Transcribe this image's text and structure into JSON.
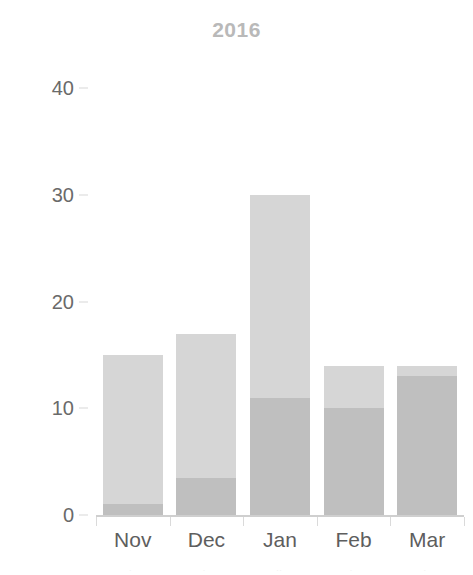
{
  "chart_data": {
    "type": "bar",
    "title": "2016",
    "subtitle": "",
    "xlabel": "",
    "ylabel": "",
    "categories": [
      "Nov",
      "Dec",
      "Jan",
      "Feb",
      "Mar"
    ],
    "stacked": true,
    "series": [
      {
        "name": "lower-segment",
        "color": "#bfbfbf",
        "values": [
          1,
          3.5,
          11,
          10,
          13
        ]
      },
      {
        "name": "upper-segment",
        "color": "#d6d6d6",
        "values": [
          14,
          13.5,
          19,
          4,
          1
        ]
      }
    ],
    "totals": [
      15,
      17,
      30,
      14,
      14
    ],
    "ylim": [
      0,
      42
    ],
    "yticks": [
      0,
      10,
      20,
      30,
      40
    ],
    "ytick_labels": [
      "0",
      "10",
      "20",
      "30",
      "40"
    ],
    "grid": false,
    "legend": "none",
    "annotations": []
  },
  "axes": {
    "y_labels": [
      "40",
      "30",
      "20",
      "10",
      "0"
    ],
    "x_labels": [
      "Nov",
      "Dec",
      "Jan",
      "Feb",
      "Mar"
    ]
  },
  "colors": {
    "title": "#b9b9b9",
    "tick_text": "#5e5e5e",
    "axis_line": "#cfcfcf",
    "bar_lower": "#bfbfbf",
    "bar_upper": "#d6d6d6",
    "background": "#ffffff"
  },
  "artifact": {
    "blips": [
      "·",
      "·",
      "··",
      "·",
      "·"
    ]
  }
}
